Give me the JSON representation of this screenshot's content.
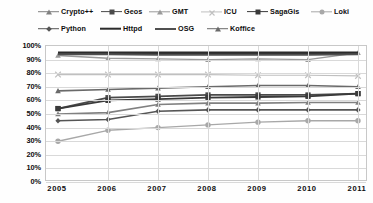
{
  "legend": {
    "items": [
      {
        "label": "Crypto++",
        "key": "cryptopp",
        "color": "#808080",
        "marker": "triangle",
        "width": 1.6
      },
      {
        "label": "Geos",
        "key": "geos",
        "color": "#4a4a4a",
        "marker": "square",
        "width": 1.8
      },
      {
        "label": "GMT",
        "key": "gmt",
        "color": "#9a9a9a",
        "marker": "triangle",
        "width": 1.4
      },
      {
        "label": "ICU",
        "key": "icu",
        "color": "#c0c0c0",
        "marker": "x",
        "width": 1.2
      },
      {
        "label": "SagaGis",
        "key": "sagagis",
        "color": "#3a3a3a",
        "marker": "square",
        "width": 1.8
      },
      {
        "label": "Loki",
        "key": "loki",
        "color": "#a8a8a8",
        "marker": "circle",
        "width": 1.4
      },
      {
        "label": "Python",
        "key": "python",
        "color": "#555555",
        "marker": "diamond",
        "width": 1.6
      },
      {
        "label": "Httpd",
        "key": "httpd",
        "color": "#2b2b2b",
        "marker": "none",
        "width": 2.6
      },
      {
        "label": "OSG",
        "key": "osg",
        "color": "#4f4f4f",
        "marker": "none",
        "width": 2.0
      },
      {
        "label": "Koffice",
        "key": "koffice",
        "color": "#6a6a6a",
        "marker": "triangle",
        "width": 1.6
      }
    ]
  },
  "axes": {
    "y_ticks": [
      "100%",
      "90%",
      "80%",
      "70%",
      "60%",
      "50%",
      "40%",
      "30%",
      "20%",
      "10%",
      "0%"
    ],
    "x_ticks": [
      "2005",
      "2006",
      "2007",
      "2008",
      "2009",
      "2010",
      "2011"
    ]
  },
  "chart_data": {
    "type": "line",
    "title": "",
    "xlabel": "",
    "ylabel": "",
    "ylim": [
      0,
      100
    ],
    "grid": true,
    "legend_position": "top",
    "x": [
      "2005",
      "2006",
      "2007",
      "2008",
      "2009",
      "2010",
      "2011"
    ],
    "categories": [
      "2005",
      "2006",
      "2007",
      "2008",
      "2009",
      "2010",
      "2011"
    ],
    "series": [
      {
        "name": "Crypto++",
        "values": [
          50,
          51,
          57,
          58,
          58,
          58.5,
          58.5
        ]
      },
      {
        "name": "Geos",
        "values": [
          54,
          62,
          63,
          64,
          64,
          64,
          65
        ]
      },
      {
        "name": "GMT",
        "values": [
          93,
          91,
          90.5,
          90,
          90.5,
          90,
          95
        ]
      },
      {
        "name": "ICU",
        "values": [
          79,
          79,
          79,
          79,
          78.5,
          78.5,
          78
        ]
      },
      {
        "name": "SagaGis",
        "values": [
          54,
          60,
          61,
          62,
          62.5,
          63,
          65
        ]
      },
      {
        "name": "Loki",
        "values": [
          30,
          38,
          40,
          42,
          44,
          45,
          45
        ]
      },
      {
        "name": "Python",
        "values": [
          45,
          46,
          52,
          53,
          53,
          53,
          53
        ]
      },
      {
        "name": "Httpd",
        "values": [
          95,
          95,
          95,
          95,
          95,
          95,
          95
        ]
      },
      {
        "name": "OSG",
        "values": [
          94,
          94,
          93.5,
          93.5,
          93.5,
          93.5,
          94
        ]
      },
      {
        "name": "Koffice",
        "values": [
          67,
          68,
          69,
          70,
          71,
          71,
          70
        ]
      }
    ]
  }
}
